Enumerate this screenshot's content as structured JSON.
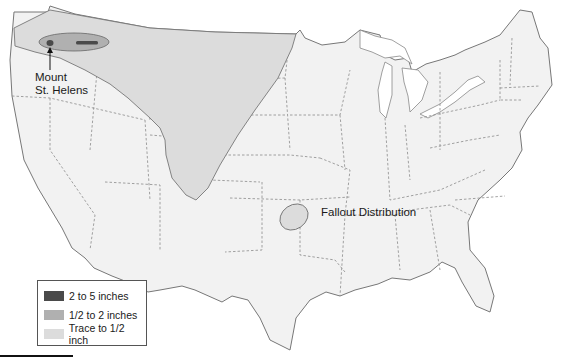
{
  "map": {
    "subject": "Mount St. Helens ash fallout across the contiguous United States",
    "region": "Contiguous United States",
    "labels": {
      "volcano": "Mount\nSt. Helens",
      "volcano_line1": "Mount",
      "volcano_line2": "St. Helens",
      "fallout": "Fallout Distribution"
    },
    "colors": {
      "land": "#f2f2f2",
      "state_border": "#8a8a8a",
      "coast": "#777777",
      "zone_heavy": "#4a4a4a",
      "zone_medium": "#b0b0b0",
      "zone_trace": "#dcdcdc"
    }
  },
  "legend": {
    "items": [
      {
        "label": "2 to 5 inches",
        "color": "#4a4a4a"
      },
      {
        "label": "1/2 to 2 inches",
        "color": "#b0b0b0"
      },
      {
        "label": "Trace to 1/2 inch",
        "color": "#dcdcdc"
      }
    ]
  }
}
